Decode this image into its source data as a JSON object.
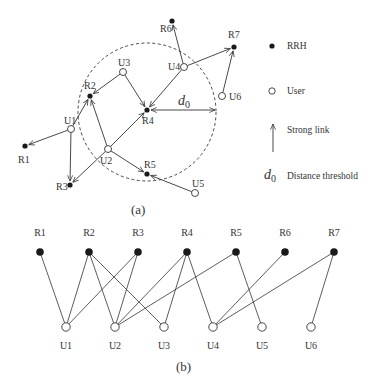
{
  "panel_a": {
    "caption": "(a)",
    "rrh_nodes": [
      {
        "id": "R1",
        "label": "R1",
        "x": 25,
        "y": 146,
        "lx": 18,
        "ly": 163
      },
      {
        "id": "R2",
        "label": "R2",
        "x": 90,
        "y": 96,
        "lx": 84,
        "ly": 89
      },
      {
        "id": "R3",
        "label": "R3",
        "x": 70,
        "y": 185,
        "lx": 56,
        "ly": 190
      },
      {
        "id": "R4",
        "label": "R4",
        "x": 147,
        "y": 110,
        "lx": 142,
        "ly": 124
      },
      {
        "id": "R5",
        "label": "R5",
        "x": 147,
        "y": 174,
        "lx": 144,
        "ly": 168
      },
      {
        "id": "R6",
        "label": "R6",
        "x": 172,
        "y": 21,
        "lx": 160,
        "ly": 32
      },
      {
        "id": "R7",
        "label": "R7",
        "x": 234,
        "y": 47,
        "lx": 228,
        "ly": 38
      }
    ],
    "user_nodes": [
      {
        "id": "U1",
        "label": "U1",
        "x": 71,
        "y": 129,
        "lx": 64,
        "ly": 124
      },
      {
        "id": "U2",
        "label": "U2",
        "x": 108,
        "y": 149,
        "lx": 100,
        "ly": 164
      },
      {
        "id": "U3",
        "label": "U3",
        "x": 123,
        "y": 72,
        "lx": 118,
        "ly": 66
      },
      {
        "id": "U4",
        "label": "U4",
        "x": 184,
        "y": 67,
        "lx": 168,
        "ly": 70
      },
      {
        "id": "U5",
        "label": "U5",
        "x": 195,
        "y": 193,
        "lx": 192,
        "ly": 187
      },
      {
        "id": "U6",
        "label": "U6",
        "x": 222,
        "y": 96,
        "lx": 229,
        "ly": 100
      }
    ],
    "strong_links": [
      {
        "from": "U1",
        "to": "R1"
      },
      {
        "from": "U1",
        "to": "R2"
      },
      {
        "from": "U1",
        "to": "R3"
      },
      {
        "from": "U2",
        "to": "R2"
      },
      {
        "from": "U2",
        "to": "R3"
      },
      {
        "from": "U2",
        "to": "R4"
      },
      {
        "from": "U2",
        "to": "R5"
      },
      {
        "from": "U3",
        "to": "R2"
      },
      {
        "from": "U3",
        "to": "R4"
      },
      {
        "from": "U4",
        "to": "R4"
      },
      {
        "from": "U4",
        "to": "R6"
      },
      {
        "from": "U4",
        "to": "R7"
      },
      {
        "from": "U5",
        "to": "R5"
      },
      {
        "from": "U6",
        "to": "R7"
      }
    ],
    "threshold_circle": {
      "cx": 147,
      "cy": 112,
      "r": 69
    },
    "d0_label": {
      "main": "d",
      "sub": "0"
    }
  },
  "legend": {
    "items": [
      {
        "symbol": "filled-dot",
        "label": "RRH"
      },
      {
        "symbol": "open-circle",
        "label": "User"
      },
      {
        "symbol": "arrow",
        "label": "Strong link"
      },
      {
        "symbol": "d0",
        "label": "Distance threshold"
      }
    ],
    "d0_symbol": {
      "main": "d",
      "sub": "0"
    }
  },
  "panel_b": {
    "caption": "(b)",
    "rrh_nodes": [
      {
        "id": "R1",
        "label": "R1",
        "x": 40
      },
      {
        "id": "R2",
        "label": "R2",
        "x": 89
      },
      {
        "id": "R3",
        "label": "R3",
        "x": 138
      },
      {
        "id": "R4",
        "label": "R4",
        "x": 187
      },
      {
        "id": "R5",
        "label": "R5",
        "x": 236
      },
      {
        "id": "R6",
        "label": "R6",
        "x": 285
      },
      {
        "id": "R7",
        "label": "R7",
        "x": 334
      }
    ],
    "user_nodes": [
      {
        "id": "U1",
        "label": "U1",
        "x": 66
      },
      {
        "id": "U2",
        "label": "U2",
        "x": 115
      },
      {
        "id": "U3",
        "label": "U3",
        "x": 164
      },
      {
        "id": "U4",
        "label": "U4",
        "x": 213
      },
      {
        "id": "U5",
        "label": "U5",
        "x": 262
      },
      {
        "id": "U6",
        "label": "U6",
        "x": 311
      }
    ],
    "rrh_y": 252,
    "user_y": 327,
    "edges": [
      [
        "R1",
        "U1"
      ],
      [
        "R2",
        "U1"
      ],
      [
        "R3",
        "U1"
      ],
      [
        "R2",
        "U2"
      ],
      [
        "R3",
        "U2"
      ],
      [
        "R4",
        "U2"
      ],
      [
        "R5",
        "U2"
      ],
      [
        "R2",
        "U3"
      ],
      [
        "R4",
        "U3"
      ],
      [
        "R4",
        "U4"
      ],
      [
        "R6",
        "U4"
      ],
      [
        "R7",
        "U4"
      ],
      [
        "R5",
        "U5"
      ],
      [
        "R7",
        "U6"
      ]
    ]
  },
  "colors": {
    "ink": "#333333",
    "node_fill": "#1a1a1a",
    "background": "#ffffff"
  }
}
